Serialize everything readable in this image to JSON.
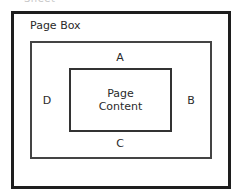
{
  "diagram": {
    "sheet_label": "Sheet",
    "page_box_label": "Page Box",
    "content_label_line1": "Page",
    "content_label_line2": "Content",
    "margins": {
      "top": "A",
      "right": "B",
      "bottom": "C",
      "left": "D"
    }
  },
  "colors": {
    "outer_border": "#1e1e1e",
    "margin_border": "#444444",
    "content_border": "#333333",
    "text": "#2a2a2a",
    "background": "#ffffff"
  }
}
